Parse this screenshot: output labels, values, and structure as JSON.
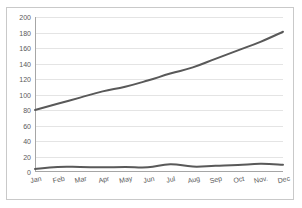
{
  "chart_data": {
    "type": "line",
    "title": "",
    "xlabel": "",
    "ylabel": "",
    "categories": [
      "Jan",
      "Feb",
      "Mar",
      "Apr",
      "May",
      "Jun",
      "Jul",
      "Aug",
      "Sep",
      "Oct",
      "Nov.",
      "Dec"
    ],
    "series": [
      {
        "name": "upper-series",
        "color": "#595959",
        "values": [
          80,
          88,
          96,
          104,
          110,
          118,
          127,
          135,
          146,
          157,
          168,
          181
        ]
      },
      {
        "name": "lower-series",
        "color": "#595959",
        "values": [
          4,
          6.5,
          6.5,
          6,
          6.5,
          6,
          10,
          7,
          8,
          9,
          10.5,
          9.5
        ]
      }
    ],
    "ylim": [
      0,
      200
    ],
    "yticks": [
      0,
      20,
      40,
      60,
      80,
      100,
      120,
      140,
      160,
      180,
      200
    ],
    "ytick_labels": [
      "0",
      "20",
      "40",
      "60",
      "80",
      "100",
      "120",
      "140",
      "160",
      "180",
      "200"
    ],
    "grid": "horizontal",
    "legend": "none",
    "plot_background": "#ffffff",
    "grid_color": "#e4e4e4",
    "axis_color": "#a6a6a6",
    "border_color": "#c9c9c9",
    "tick_label_color": "#5a5a5a"
  }
}
